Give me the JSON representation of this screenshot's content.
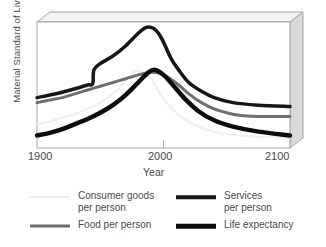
{
  "chart_data": {
    "type": "line",
    "title": "",
    "xlabel": "Year",
    "ylabel": "Material Standard of Living",
    "xlim": [
      1900,
      2100
    ],
    "ylim": [
      0,
      100
    ],
    "xticks": [
      1900,
      2000,
      2100
    ],
    "xtick_labels": [
      "1900",
      "2000",
      "2100"
    ],
    "yticks": [],
    "ytick_labels": [],
    "grid": false,
    "legend_position": "below",
    "style_note": "3d-box-frame",
    "series": [
      {
        "name": "Consumer goods per person",
        "color": "#efefef",
        "width": 2,
        "x": [
          1900,
          1910,
          1920,
          1930,
          1940,
          1950,
          1960,
          1970,
          1975,
          1978,
          1982,
          1986,
          1990,
          1995,
          2000,
          2010,
          2020,
          2030,
          2040,
          2050,
          2060,
          2075,
          2100
        ],
        "y": [
          19,
          21,
          24,
          27,
          31,
          36,
          43,
          53,
          59,
          61,
          61,
          59,
          55,
          47,
          39,
          28,
          21,
          16,
          13,
          11,
          10,
          9,
          8
        ]
      },
      {
        "name": "Food per person",
        "color": "#6f6f6f",
        "width": 3,
        "x": [
          1900,
          1910,
          1920,
          1930,
          1940,
          1950,
          1960,
          1970,
          1980,
          1988,
          1994,
          1998,
          2004,
          2012,
          2020,
          2030,
          2040,
          2050,
          2060,
          2075,
          2090,
          2100
        ],
        "y": [
          36,
          38,
          40,
          43,
          46,
          49,
          52,
          55,
          58,
          60,
          60,
          59,
          56,
          50,
          43,
          36,
          31,
          28,
          26,
          25,
          25,
          25
        ]
      },
      {
        "name": "Services per person",
        "color": "#171717",
        "width": 3.5,
        "x": [
          1900,
          1915,
          1930,
          1940,
          1944,
          1945,
          1950,
          1960,
          1970,
          1980,
          1985,
          1988,
          1992,
          1996,
          2000,
          2006,
          2012,
          2020,
          2030,
          2040,
          2055,
          2075,
          2100
        ],
        "y": [
          40,
          43,
          47,
          50,
          51,
          62,
          67,
          73,
          81,
          91,
          95,
          96,
          95,
          91,
          84,
          71,
          62,
          52,
          45,
          40,
          36,
          34,
          33
        ]
      },
      {
        "name": "Life expectancy",
        "color": "#0c0c0c",
        "width": 4.5,
        "x": [
          1900,
          1910,
          1920,
          1930,
          1940,
          1950,
          1960,
          1970,
          1980,
          1988,
          1992,
          1996,
          2000,
          2004,
          2010,
          2018,
          2028,
          2040,
          2055,
          2075,
          2100
        ],
        "y": [
          10,
          12,
          15,
          19,
          23,
          28,
          34,
          42,
          52,
          60,
          62,
          61,
          58,
          54,
          47,
          38,
          29,
          22,
          17,
          13,
          10
        ]
      }
    ]
  },
  "axes": {
    "ylabel": "Material Standard of Living",
    "xlabel": "Year",
    "xtick_1900": "1900",
    "xtick_2000": "2000",
    "xtick_2100": "2100"
  },
  "legend": {
    "items": [
      {
        "label_line1": "Consumer goods",
        "label_line2": "per person",
        "color": "#efefef",
        "swatch": "line-swatch-light"
      },
      {
        "label_line1": "Food per person",
        "label_line2": "",
        "color": "#6f6f6f",
        "swatch": "line-swatch-gray"
      },
      {
        "label_line1": "Services",
        "label_line2": "per person",
        "color": "#171717",
        "swatch": "line-swatch-dark"
      },
      {
        "label_line1": "Life expectancy",
        "label_line2": "",
        "color": "#0c0c0c",
        "swatch": "line-swatch-black"
      }
    ]
  },
  "frame": {
    "panel_top_color": "#f2f2f2",
    "panel_side_color": "#d8d8d8",
    "edge_color": "#9a9a9a"
  }
}
